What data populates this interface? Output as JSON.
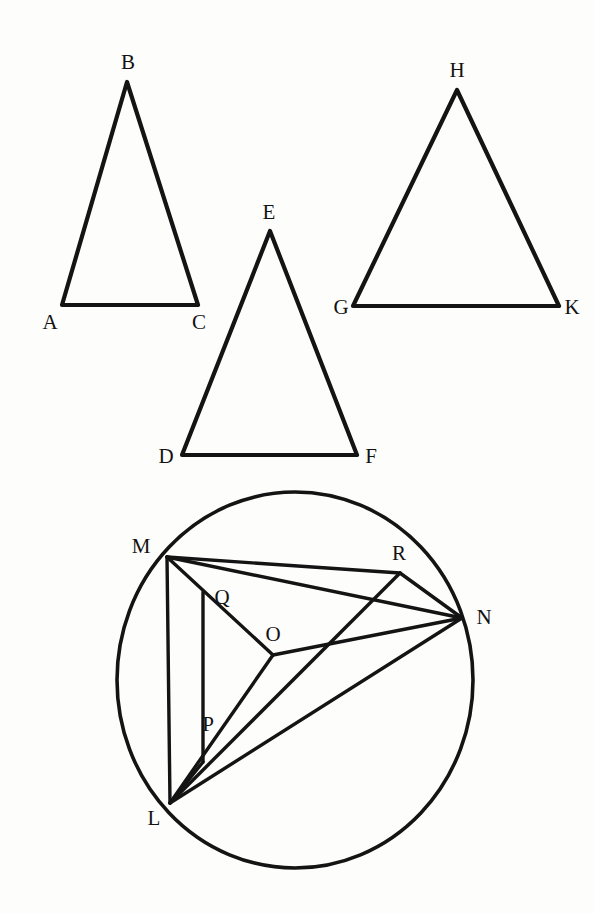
{
  "figure": {
    "background_color": "#fdfdfc",
    "ink_color": "#141414"
  },
  "chart_data": {
    "type": "diagram",
    "coordinate_space": {
      "width": 594,
      "height": 913
    },
    "shapes": [
      {
        "name": "triangle-abc",
        "kind": "triangle",
        "vertices": [
          {
            "label": "A",
            "x": 62,
            "y": 305
          },
          {
            "label": "B",
            "x": 127,
            "y": 82
          },
          {
            "label": "C",
            "x": 198,
            "y": 305
          }
        ],
        "edges": [
          [
            "A",
            "B"
          ],
          [
            "B",
            "C"
          ],
          [
            "C",
            "A"
          ]
        ]
      },
      {
        "name": "triangle-def",
        "kind": "triangle",
        "vertices": [
          {
            "label": "D",
            "x": 182,
            "y": 455
          },
          {
            "label": "E",
            "x": 270,
            "y": 231
          },
          {
            "label": "F",
            "x": 357,
            "y": 455
          }
        ],
        "edges": [
          [
            "D",
            "E"
          ],
          [
            "E",
            "F"
          ],
          [
            "F",
            "D"
          ]
        ]
      },
      {
        "name": "triangle-ghk",
        "kind": "triangle",
        "vertices": [
          {
            "label": "G",
            "x": 353,
            "y": 306
          },
          {
            "label": "H",
            "x": 457,
            "y": 90
          },
          {
            "label": "K",
            "x": 559,
            "y": 306
          }
        ],
        "edges": [
          [
            "G",
            "H"
          ],
          [
            "H",
            "K"
          ],
          [
            "K",
            "G"
          ]
        ]
      },
      {
        "name": "circle-lmnr",
        "kind": "circle",
        "center": {
          "x": 295,
          "y": 680
        },
        "radius_x": 178,
        "radius_y": 188,
        "points": [
          {
            "label": "M",
            "x": 167,
            "y": 557,
            "on_circle": true
          },
          {
            "label": "N",
            "x": 462,
            "y": 618,
            "on_circle": true
          },
          {
            "label": "L",
            "x": 170,
            "y": 803,
            "on_circle": true
          },
          {
            "label": "R",
            "x": 400,
            "y": 573,
            "on_circle": true
          },
          {
            "label": "O",
            "x": 273,
            "y": 655,
            "on_circle": false
          },
          {
            "label": "Q",
            "x": 203,
            "y": 592,
            "on_circle": false
          },
          {
            "label": "P",
            "x": 203,
            "y": 762,
            "on_circle": false
          }
        ],
        "segments": [
          [
            "M",
            "R"
          ],
          [
            "R",
            "N"
          ],
          [
            "M",
            "N"
          ],
          [
            "M",
            "O"
          ],
          [
            "O",
            "N"
          ],
          [
            "O",
            "L"
          ],
          [
            "M",
            "L"
          ],
          [
            "Q",
            "P"
          ],
          [
            "P",
            "L"
          ],
          [
            "R",
            "L"
          ],
          [
            "L",
            "N"
          ]
        ]
      }
    ]
  },
  "labels": {
    "A": {
      "text": "A",
      "x": 50,
      "y": 322
    },
    "B": {
      "text": "B",
      "x": 128,
      "y": 62
    },
    "C": {
      "text": "C",
      "x": 199,
      "y": 322
    },
    "D": {
      "text": "D",
      "x": 166,
      "y": 456
    },
    "E": {
      "text": "E",
      "x": 269,
      "y": 212
    },
    "F": {
      "text": "F",
      "x": 371,
      "y": 456
    },
    "G": {
      "text": "G",
      "x": 341,
      "y": 307
    },
    "H": {
      "text": "H",
      "x": 457,
      "y": 70
    },
    "K": {
      "text": "K",
      "x": 572,
      "y": 307
    },
    "M": {
      "text": "M",
      "x": 141,
      "y": 546
    },
    "N": {
      "text": "N",
      "x": 484,
      "y": 617
    },
    "L": {
      "text": "L",
      "x": 154,
      "y": 818
    },
    "O": {
      "text": "O",
      "x": 273,
      "y": 634
    },
    "P": {
      "text": "P",
      "x": 208,
      "y": 724
    },
    "Q": {
      "text": "Q",
      "x": 222,
      "y": 597
    },
    "R": {
      "text": "R",
      "x": 399,
      "y": 553
    }
  }
}
